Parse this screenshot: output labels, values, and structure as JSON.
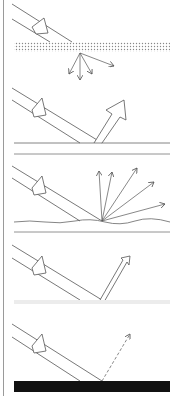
{
  "diagram": {
    "panels": [
      {
        "id": "translucent-scatter",
        "surface": "dotted-layer",
        "reflection": "scattered-through",
        "outgoing_rays": 4
      },
      {
        "id": "specular",
        "surface": "smooth-line",
        "reflection": "single-broad-arrow",
        "outgoing_rays": 1
      },
      {
        "id": "diffuse",
        "surface": "rough-line",
        "reflection": "fan-of-arrows",
        "outgoing_rays": 5
      },
      {
        "id": "glossy",
        "surface": "faint-surface",
        "reflection": "single-narrow-arrow",
        "outgoing_rays": 1
      },
      {
        "id": "absorbed",
        "surface": "black-block",
        "reflection": "dashed-arrow",
        "outgoing_rays": 1
      }
    ],
    "colors": {
      "line": "#555555",
      "surface_black": "#111111",
      "dots": "#888888",
      "divider": "#777777",
      "faint_surface": "#ececec"
    }
  }
}
